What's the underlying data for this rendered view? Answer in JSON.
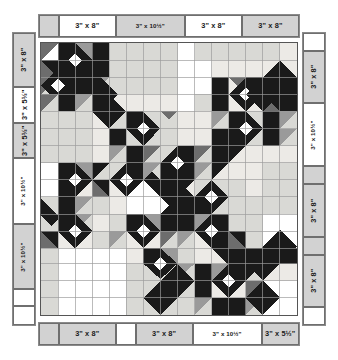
{
  "diagram": {
    "unit_label_suffix": "\"",
    "colors": {
      "border_gray": "#d2d2d2",
      "border_white": "#ffffff",
      "outline": "#6f6f6f",
      "quilt_black": "#1a1a1a",
      "quilt_dark_gray": "#6d6d6d",
      "quilt_mid_gray": "#9a9a9a",
      "quilt_light_gray": "#d9d9d5",
      "quilt_white": "#ffffff",
      "quilt_background": "#eceae6",
      "quilt_grid_line": "#9b9b9b"
    }
  },
  "top_border": {
    "name": "top-border",
    "segments": [
      {
        "label": "",
        "fill": "gray",
        "span": 1
      },
      {
        "label": "3\" x 8\"",
        "fill": "white",
        "span": 2.9
      },
      {
        "label": "3\" x 10½\"",
        "fill": "gray",
        "span": 3.5
      },
      {
        "label": "3\" x 8\"",
        "fill": "white",
        "span": 2.9
      },
      {
        "label": "3\" x 8\"",
        "fill": "gray",
        "span": 2.9
      }
    ]
  },
  "bottom_border": {
    "name": "bottom-border",
    "segments": [
      {
        "label": "",
        "fill": "gray",
        "span": 1
      },
      {
        "label": "3\" x 8\"",
        "fill": "gray",
        "span": 2.9
      },
      {
        "label": "",
        "fill": "white",
        "span": 1
      },
      {
        "label": "3\" x 8\"",
        "fill": "gray",
        "span": 2.9
      },
      {
        "label": "3\" x 10½\"",
        "fill": "white",
        "span": 3.5
      },
      {
        "label": "3\" x 5½\"",
        "fill": "gray",
        "span": 1.9
      }
    ]
  },
  "left_border": {
    "name": "left-border",
    "segments": [
      {
        "label": "3\" x 8\"",
        "fill": "gray",
        "span": 2.9
      },
      {
        "label": "3\" x 5½\"",
        "fill": "white",
        "span": 1.9
      },
      {
        "label": "3\" x 5½\"",
        "fill": "gray",
        "span": 1.9
      },
      {
        "label": "3\" x 10½\"",
        "fill": "white",
        "span": 3.5
      },
      {
        "label": "3\" x 10½\"",
        "fill": "gray",
        "span": 3.5
      },
      {
        "label": "",
        "fill": "white",
        "span": 0.9
      },
      {
        "label": "",
        "fill": "white",
        "span": 1.0
      }
    ]
  },
  "right_border": {
    "name": "right-border",
    "segments": [
      {
        "label": "",
        "fill": "white",
        "span": 1.0
      },
      {
        "label": "3\" x 8\"",
        "fill": "gray",
        "span": 2.9
      },
      {
        "label": "3\" x 10½\"",
        "fill": "white",
        "span": 3.5
      },
      {
        "label": "",
        "fill": "gray",
        "span": 1.0
      },
      {
        "label": "3\" x 8\"",
        "fill": "gray",
        "span": 2.9
      },
      {
        "label": "",
        "fill": "gray",
        "span": 1.0
      },
      {
        "label": "3\" x 8\"",
        "fill": "gray",
        "span": 2.9
      },
      {
        "label": "",
        "fill": "white",
        "span": 1.0
      }
    ]
  },
  "quilt": {
    "name": "quilt-center-layout",
    "grid_cols": 15,
    "grid_rows": 16,
    "description": "Scrappy star / chain quilt center with dark diagonal chains running corner to corner"
  }
}
